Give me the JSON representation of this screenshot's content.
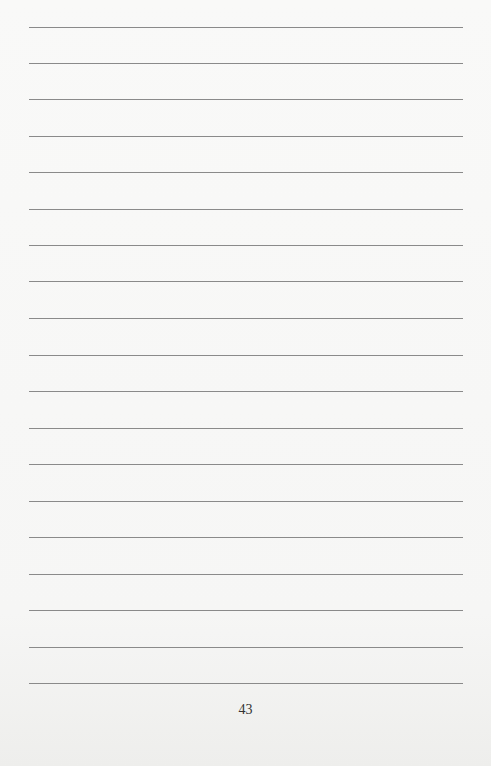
{
  "page": {
    "type": "lined-notebook-page",
    "line_count": 19,
    "line_positions_y": [
      27,
      63,
      99,
      136,
      172,
      209,
      245,
      281,
      318,
      355,
      391,
      428,
      464,
      501,
      537,
      574,
      610,
      647,
      683
    ],
    "line_color": "#8a8a8a",
    "background_color": "#f7f7f6",
    "page_number": "43"
  }
}
